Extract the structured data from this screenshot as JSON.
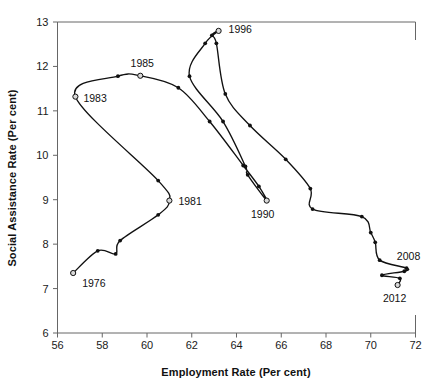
{
  "chart_data": {
    "type": "line",
    "title": "",
    "subtitle": "",
    "xlabel": "Employment Rate (Per cent)",
    "ylabel": "Social Assistance Rate (Per cent)",
    "xlim": [
      56,
      72
    ],
    "ylim": [
      6,
      13
    ],
    "xticks": [
      56,
      58,
      60,
      62,
      64,
      66,
      68,
      70,
      72
    ],
    "yticks": [
      6,
      7,
      8,
      9,
      10,
      11,
      12,
      13
    ],
    "grid": false,
    "legend": null,
    "series": [
      {
        "name": "Employment Rate vs Social Assistance Rate (1976-2012)",
        "x_key": "employment_rate",
        "y_key": "social_assistance_rate",
        "points": [
          {
            "year": 1976,
            "employment_rate": 56.7,
            "social_assistance_rate": 7.35,
            "marker": "open"
          },
          {
            "year": 1977,
            "employment_rate": 57.8,
            "social_assistance_rate": 7.85,
            "marker": "filled"
          },
          {
            "year": 1978,
            "employment_rate": 58.6,
            "social_assistance_rate": 7.78,
            "marker": "filled"
          },
          {
            "year": 1979,
            "employment_rate": 58.8,
            "social_assistance_rate": 8.08,
            "marker": "filled"
          },
          {
            "year": 1980,
            "employment_rate": 60.5,
            "social_assistance_rate": 8.66,
            "marker": "filled"
          },
          {
            "year": 1981,
            "employment_rate": 61.0,
            "social_assistance_rate": 8.98,
            "marker": "open"
          },
          {
            "year": 1982,
            "employment_rate": 60.5,
            "social_assistance_rate": 9.43,
            "marker": "filled"
          },
          {
            "year": 1983,
            "employment_rate": 56.8,
            "social_assistance_rate": 11.32,
            "marker": "open"
          },
          {
            "year": 1984,
            "employment_rate": 58.7,
            "social_assistance_rate": 11.78,
            "marker": "filled"
          },
          {
            "year": 1985,
            "employment_rate": 59.7,
            "social_assistance_rate": 11.79,
            "marker": "open"
          },
          {
            "year": 1986,
            "employment_rate": 61.4,
            "social_assistance_rate": 11.52,
            "marker": "filled"
          },
          {
            "year": 1987,
            "employment_rate": 62.8,
            "social_assistance_rate": 10.76,
            "marker": "filled"
          },
          {
            "year": 1988,
            "employment_rate": 64.3,
            "social_assistance_rate": 9.77,
            "marker": "filled"
          },
          {
            "year": 1989,
            "employment_rate": 65.0,
            "social_assistance_rate": 9.3,
            "marker": "filled"
          },
          {
            "year": 1990,
            "employment_rate": 65.35,
            "social_assistance_rate": 8.98,
            "marker": "open"
          },
          {
            "year": 1991,
            "employment_rate": 64.5,
            "social_assistance_rate": 9.56,
            "marker": "filled"
          },
          {
            "year": 1992,
            "employment_rate": 64.4,
            "social_assistance_rate": 9.75,
            "marker": "filled"
          },
          {
            "year": 1993,
            "employment_rate": 63.4,
            "social_assistance_rate": 10.76,
            "marker": "filled"
          },
          {
            "year": 1994,
            "employment_rate": 61.9,
            "social_assistance_rate": 11.78,
            "marker": "filled"
          },
          {
            "year": 1995,
            "employment_rate": 62.6,
            "social_assistance_rate": 12.52,
            "marker": "filled"
          },
          {
            "year": 1996,
            "employment_rate": 63.2,
            "social_assistance_rate": 12.8,
            "marker": "open"
          },
          {
            "year": 1997,
            "employment_rate": 62.9,
            "social_assistance_rate": 12.7,
            "marker": "filled"
          },
          {
            "year": 1998,
            "employment_rate": 63.1,
            "social_assistance_rate": 12.52,
            "marker": "filled"
          },
          {
            "year": 1999,
            "employment_rate": 63.5,
            "social_assistance_rate": 11.38,
            "marker": "filled"
          },
          {
            "year": 2000,
            "employment_rate": 64.6,
            "social_assistance_rate": 10.67,
            "marker": "filled"
          },
          {
            "year": 2001,
            "employment_rate": 66.2,
            "social_assistance_rate": 9.91,
            "marker": "filled"
          },
          {
            "year": 2002,
            "employment_rate": 67.3,
            "social_assistance_rate": 9.25,
            "marker": "filled"
          },
          {
            "year": 2003,
            "employment_rate": 67.4,
            "social_assistance_rate": 8.79,
            "marker": "filled"
          },
          {
            "year": 2004,
            "employment_rate": 69.6,
            "social_assistance_rate": 8.62,
            "marker": "filled"
          },
          {
            "year": 2005,
            "employment_rate": 70.0,
            "social_assistance_rate": 8.26,
            "marker": "filled"
          },
          {
            "year": 2006,
            "employment_rate": 70.2,
            "social_assistance_rate": 8.04,
            "marker": "filled"
          },
          {
            "year": 2007,
            "employment_rate": 70.4,
            "social_assistance_rate": 7.64,
            "marker": "filled"
          },
          {
            "year": 2008,
            "employment_rate": 71.6,
            "social_assistance_rate": 7.46,
            "marker": "filled"
          },
          {
            "year": 2009,
            "employment_rate": 71.5,
            "social_assistance_rate": 7.39,
            "marker": "filled"
          },
          {
            "year": 2010,
            "employment_rate": 70.5,
            "social_assistance_rate": 7.3,
            "marker": "filled"
          },
          {
            "year": 2011,
            "employment_rate": 71.3,
            "social_assistance_rate": 7.23,
            "marker": "filled"
          },
          {
            "year": 2012,
            "employment_rate": 71.2,
            "social_assistance_rate": 7.08,
            "marker": "open"
          }
        ]
      }
    ],
    "annotations": [
      {
        "text": "1976",
        "x": 56.7,
        "y": 7.35,
        "dx": 9,
        "dy": 14,
        "anchor": "start"
      },
      {
        "text": "1981",
        "x": 61.0,
        "y": 8.98,
        "dx": 9,
        "dy": 4,
        "anchor": "start"
      },
      {
        "text": "1983",
        "x": 56.8,
        "y": 11.32,
        "dx": 8,
        "dy": 5,
        "anchor": "start"
      },
      {
        "text": "1985",
        "x": 59.7,
        "y": 11.79,
        "dx": 2,
        "dy": -9,
        "anchor": "middle"
      },
      {
        "text": "1990",
        "x": 65.35,
        "y": 8.98,
        "dx": -4,
        "dy": 17,
        "anchor": "middle"
      },
      {
        "text": "1996",
        "x": 63.2,
        "y": 12.8,
        "dx": 10,
        "dy": 2,
        "anchor": "start"
      },
      {
        "text": "2008",
        "x": 71.6,
        "y": 7.46,
        "dx": 2,
        "dy": -8,
        "anchor": "middle"
      },
      {
        "text": "2012",
        "x": 71.2,
        "y": 7.08,
        "dx": -3,
        "dy": 17,
        "anchor": "middle"
      }
    ],
    "colors": {
      "line": "#111111",
      "marker_fill": "#111111",
      "marker_open_fill": "#d8d8d8",
      "axis": "#666666",
      "text": "#111111",
      "background": "#ffffff"
    }
  },
  "axes": {
    "x_title": "Employment Rate (Per cent)",
    "y_title": "Social Assistance Rate (Per cent)",
    "x_tick_labels": [
      "56",
      "58",
      "60",
      "62",
      "64",
      "66",
      "68",
      "70",
      "72"
    ],
    "y_tick_labels": [
      "6",
      "7",
      "8",
      "9",
      "10",
      "11",
      "12",
      "13"
    ]
  }
}
